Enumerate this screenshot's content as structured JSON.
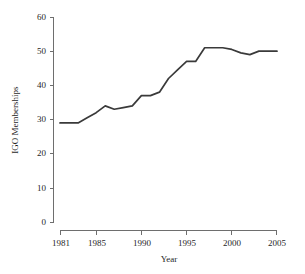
{
  "chart_data": {
    "type": "line",
    "title": "",
    "xlabel": "Year",
    "ylabel": "IGO Memberships",
    "x": [
      1981,
      1982,
      1983,
      1984,
      1985,
      1986,
      1987,
      1988,
      1989,
      1990,
      1991,
      1992,
      1993,
      1994,
      1995,
      1996,
      1997,
      1998,
      1999,
      2000,
      2001,
      2002,
      2003,
      2004,
      2005
    ],
    "values": [
      29,
      29,
      29,
      30.5,
      32,
      34,
      33,
      33.5,
      34,
      37,
      37,
      38,
      42,
      44.5,
      47,
      47,
      51,
      51,
      51,
      50.5,
      49.5,
      49,
      50,
      50,
      50
    ],
    "series": [
      {
        "name": "IGO Memberships",
        "values": [
          29,
          29,
          29,
          30.5,
          32,
          34,
          33,
          33.5,
          34,
          37,
          37,
          38,
          42,
          44.5,
          47,
          47,
          51,
          51,
          51,
          50.5,
          49.5,
          49,
          50,
          50,
          50
        ]
      }
    ],
    "xlim": [
      1981,
      2005
    ],
    "ylim": [
      0,
      60
    ],
    "xticks": [
      1981,
      1985,
      1990,
      1995,
      2000,
      2005
    ],
    "xtick_labels": [
      "1981",
      "1985",
      "1990",
      "1995",
      "2000",
      "2005"
    ],
    "yticks": [
      0,
      10,
      20,
      30,
      40,
      50,
      60
    ],
    "ytick_labels": [
      "0",
      "10",
      "20",
      "30",
      "40",
      "50",
      "60"
    ],
    "grid": false,
    "legend": false,
    "line_color": "#3a3a3a",
    "axis_color": "#6e6e6e"
  },
  "axes": {
    "y_title": "IGO Memberships",
    "x_title": "Year"
  }
}
